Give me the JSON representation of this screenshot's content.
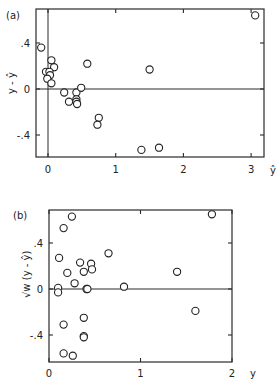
{
  "chart_data": [
    {
      "type": "scatter",
      "panel_label": "(a)",
      "title": "",
      "xlabel": "ŷ",
      "ylabel": "y - ŷ",
      "xlim": [
        -0.18,
        3.2
      ],
      "ylim": [
        -0.6,
        0.7
      ],
      "xticks": [
        "0",
        "1",
        "2",
        "3"
      ],
      "yticks": [
        ".4",
        "0",
        "-.4"
      ],
      "grid": false,
      "reference_lines": {
        "horizontal_y": 0,
        "vertical_x": 0
      },
      "marker": "open-circle",
      "points": [
        {
          "x": -0.1,
          "y": 0.36
        },
        {
          "x": 0.05,
          "y": 0.25
        },
        {
          "x": 0.09,
          "y": 0.19
        },
        {
          "x": -0.03,
          "y": 0.15
        },
        {
          "x": 0.02,
          "y": 0.15
        },
        {
          "x": 0.03,
          "y": 0.12
        },
        {
          "x": -0.01,
          "y": 0.09
        },
        {
          "x": 0.05,
          "y": 0.05
        },
        {
          "x": 0.58,
          "y": 0.22
        },
        {
          "x": 1.5,
          "y": 0.17
        },
        {
          "x": 0.24,
          "y": -0.03
        },
        {
          "x": 0.31,
          "y": -0.11
        },
        {
          "x": 0.42,
          "y": -0.03
        },
        {
          "x": 0.42,
          "y": -0.09
        },
        {
          "x": 0.42,
          "y": -0.11
        },
        {
          "x": 0.43,
          "y": -0.13
        },
        {
          "x": 0.49,
          "y": 0.01
        },
        {
          "x": 0.75,
          "y": -0.25
        },
        {
          "x": 0.73,
          "y": -0.31
        },
        {
          "x": 1.38,
          "y": -0.53
        },
        {
          "x": 1.64,
          "y": -0.51
        },
        {
          "x": 3.06,
          "y": 0.64
        }
      ]
    },
    {
      "type": "scatter",
      "panel_label": "(b)",
      "title": "",
      "xlabel": "y",
      "ylabel": "√w (y - ŷ)",
      "xlim": [
        0,
        2
      ],
      "ylim": [
        -0.62,
        0.68
      ],
      "xticks": [
        "0",
        "1",
        "2"
      ],
      "yticks": [
        ".4",
        "0",
        "-.4"
      ],
      "grid": false,
      "reference_lines": {
        "horizontal_y": 0
      },
      "marker": "open-circle",
      "points": [
        {
          "x": 0.25,
          "y": 0.63
        },
        {
          "x": 0.16,
          "y": 0.53
        },
        {
          "x": 1.78,
          "y": 0.65
        },
        {
          "x": 0.65,
          "y": 0.31
        },
        {
          "x": 0.11,
          "y": 0.27
        },
        {
          "x": 0.34,
          "y": 0.23
        },
        {
          "x": 0.46,
          "y": 0.22
        },
        {
          "x": 0.47,
          "y": 0.17
        },
        {
          "x": 0.38,
          "y": 0.15
        },
        {
          "x": 0.2,
          "y": 0.14
        },
        {
          "x": 1.4,
          "y": 0.15
        },
        {
          "x": 0.28,
          "y": 0.05
        },
        {
          "x": 0.1,
          "y": 0.01
        },
        {
          "x": 0.1,
          "y": -0.03
        },
        {
          "x": 0.41,
          "y": 0.0
        },
        {
          "x": 0.42,
          "y": 0.0
        },
        {
          "x": 0.82,
          "y": 0.02
        },
        {
          "x": 1.6,
          "y": -0.19
        },
        {
          "x": 0.38,
          "y": -0.25
        },
        {
          "x": 0.16,
          "y": -0.31
        },
        {
          "x": 0.38,
          "y": -0.41
        },
        {
          "x": 0.38,
          "y": -0.42
        },
        {
          "x": 0.16,
          "y": -0.56
        },
        {
          "x": 0.26,
          "y": -0.58
        }
      ]
    }
  ],
  "panels": {
    "a": {
      "label": "(a)",
      "xlabel": "ŷ",
      "ylabel": "y - ŷ",
      "xticks": [
        "0",
        "1",
        "2",
        "3"
      ],
      "yticks": [
        ".4",
        "0",
        "-.4"
      ]
    },
    "b": {
      "label": "(b)",
      "xlabel": "y",
      "ylabel": "√w (y - ŷ)",
      "xticks": [
        "0",
        "1",
        "2"
      ],
      "yticks": [
        ".4",
        "0",
        "-.4"
      ]
    }
  }
}
